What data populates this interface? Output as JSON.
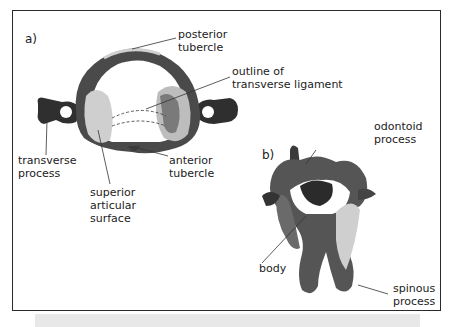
{
  "figure": {
    "panels": [
      {
        "letter": "a)",
        "labels": {
          "posterior_tubercle": [
            "posterior",
            "tubercle"
          ],
          "transverse_ligament": [
            "outline of",
            "transverse ligament"
          ],
          "transverse_process": [
            "transverse",
            "process"
          ],
          "superior_articular_surface": [
            "superior",
            "articular",
            "surface"
          ],
          "anterior_tubercle": [
            "anterior",
            "tubercle"
          ]
        }
      },
      {
        "letter": "b)",
        "labels": {
          "odontoid_process": [
            "odontoid",
            "process"
          ],
          "body": [
            "body"
          ],
          "spinous_process": [
            "spinous",
            "process"
          ]
        }
      }
    ]
  },
  "colors": {
    "border": "#2a2a2a",
    "text": "#222222",
    "bone_dark": "#2b2b2b",
    "bone_mid": "#8a8a8a",
    "bone_light": "#d8d8d8",
    "caption_bg": "#e8e8e8"
  }
}
